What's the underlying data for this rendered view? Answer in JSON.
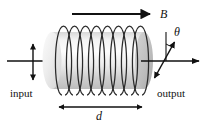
{
  "figure": {
    "name": "faraday-rotation-solenoid-diagram",
    "background_color": "#ffffff",
    "stroke_color": "#111111",
    "width": 207,
    "height": 128
  },
  "labels": {
    "input": "input",
    "output": "output",
    "magnetic_field": "B",
    "length": "d",
    "rotation_angle": "θ"
  },
  "elements": {
    "field_arrow": {
      "name": "magnetic-field-arrow",
      "direction": "right",
      "x1": 72,
      "y1": 14,
      "x2": 150,
      "y2": 14
    },
    "length_arrow": {
      "name": "length-dimension-arrow",
      "direction": "double",
      "x1": 58,
      "y1": 107,
      "x2": 143,
      "y2": 107
    },
    "input_beam": {
      "name": "input-beam-arrow",
      "direction": "right",
      "x1": 8,
      "y1": 61,
      "x2": 52,
      "y2": 61
    },
    "input_polarization": {
      "name": "input-polarization-arrow",
      "direction": "double-vertical",
      "x1": 33,
      "y1": 42,
      "x2": 33,
      "y2": 82
    },
    "output_beam": {
      "name": "output-beam-arrow",
      "direction": "right",
      "x1": 141,
      "y1": 61,
      "x2": 198,
      "y2": 61
    },
    "output_polarization": {
      "name": "output-polarization-arrow",
      "direction": "double-tilted",
      "x1": 154,
      "y1": 79,
      "x2": 175,
      "y2": 41,
      "tilt_degrees": 29
    },
    "reference_line": {
      "name": "vertical-reference-line",
      "x1": 166,
      "y1": 33,
      "x2": 166,
      "y2": 61
    },
    "angle_arc": {
      "name": "theta-angle-arc"
    },
    "solenoid": {
      "name": "solenoid-cylinder",
      "body_left": 52,
      "body_right": 144,
      "body_top": 32,
      "body_bottom": 89,
      "coil_count": 8,
      "coil_top": 26,
      "coil_bottom": 95,
      "fill_light": "#f2f2f2",
      "fill_mid": "#e3e3e3",
      "fill_dark": "#b9b9b9"
    }
  }
}
